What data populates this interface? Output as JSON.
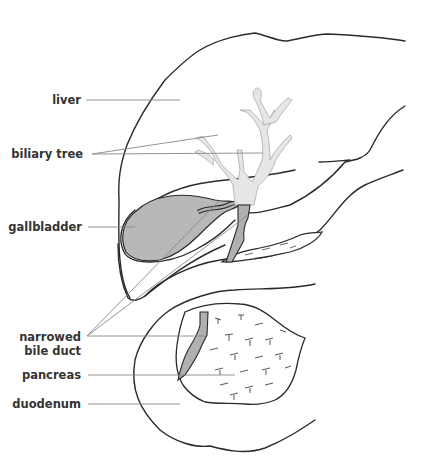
{
  "diagram": {
    "type": "anatomical illustration",
    "colors": {
      "outline": "#2a2a2a",
      "leader_line": "#888888",
      "gallbladder_fill": "#b8b8b8",
      "biliary_tree_fill": "#e6e6e6",
      "bile_duct_fill": "#b0b0b0",
      "background": "#ffffff"
    },
    "labels": [
      {
        "id": "liver",
        "text": "liver"
      },
      {
        "id": "biliary_tree",
        "text": "biliary tree"
      },
      {
        "id": "gallbladder",
        "text": "gallbladder"
      },
      {
        "id": "narrowed_bile_duct_1",
        "text": "narrowed"
      },
      {
        "id": "narrowed_bile_duct_2",
        "text": "bile duct"
      },
      {
        "id": "pancreas",
        "text": "pancreas"
      },
      {
        "id": "duodenum",
        "text": "duodenum"
      }
    ]
  }
}
